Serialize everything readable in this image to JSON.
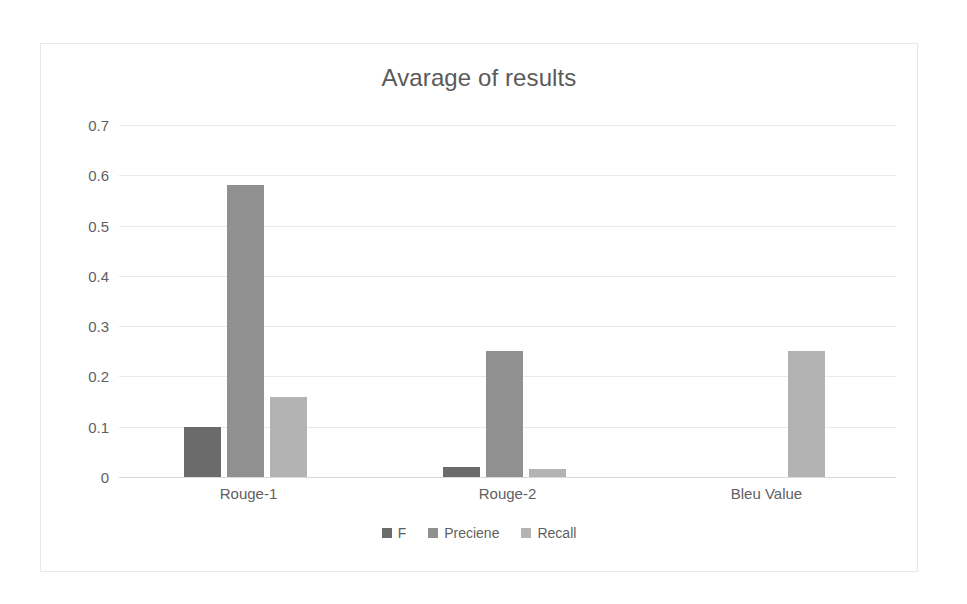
{
  "chart_data": {
    "type": "bar",
    "title": "Avarage of results",
    "xlabel": "",
    "ylabel": "",
    "categories": [
      "Rouge-1",
      "Rouge-2",
      "Bleu Value"
    ],
    "series": [
      {
        "name": "F",
        "color": "#6b6b6b",
        "values": [
          0.1,
          0.02,
          null
        ]
      },
      {
        "name": "Preciene",
        "color": "#909090",
        "values": [
          0.58,
          0.25,
          null
        ]
      },
      {
        "name": "Recall",
        "color": "#b3b3b3",
        "values": [
          0.16,
          0.015,
          0.25
        ]
      }
    ],
    "ylim": [
      0,
      0.7
    ],
    "yticks": [
      "0",
      "0.1",
      "0.2",
      "0.3",
      "0.4",
      "0.5",
      "0.6",
      "0.7"
    ],
    "ytick_values": [
      0,
      0.1,
      0.2,
      0.3,
      0.4,
      0.5,
      0.6,
      0.7
    ],
    "grid": true,
    "legend_position": "bottom",
    "legend": [
      "F",
      "Preciene",
      "Recall"
    ],
    "background": "#ffffff",
    "border_color": "#e8e8e8",
    "gridline_color": "#e9e9e9",
    "text_color": "#5f5f5f"
  }
}
